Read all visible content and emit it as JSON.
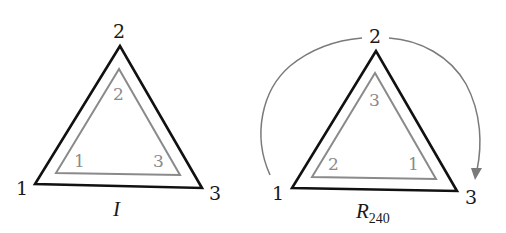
{
  "colors": {
    "outer_triangle": "#111111",
    "inner_triangle": "#8a8a8a",
    "arc": "#7a7a7a",
    "outer_label": "#1a1a1a",
    "inner_label": "#8a8a8a",
    "background": "#ffffff"
  },
  "diagrams": [
    {
      "caption": "I",
      "caption_sub": "",
      "outer_labels": {
        "left": "1",
        "top": "2",
        "right": "3"
      },
      "inner_labels": {
        "left": "1",
        "top": "2",
        "right": "3"
      },
      "has_rotation_arrow": false
    },
    {
      "caption": "R",
      "caption_sub": "240",
      "outer_labels": {
        "left": "1",
        "top": "2",
        "right": "3"
      },
      "inner_labels": {
        "left": "2",
        "top": "3",
        "right": "1"
      },
      "has_rotation_arrow": true,
      "rotation_arrow_direction": "clockwise"
    }
  ]
}
